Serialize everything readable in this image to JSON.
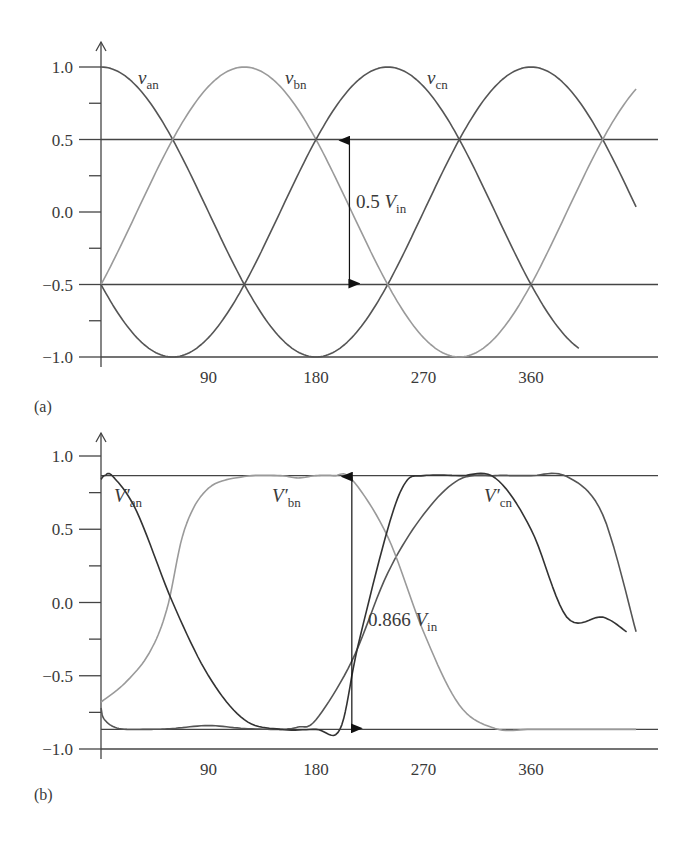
{
  "chart_data": [
    {
      "id": "a",
      "type": "line",
      "panel_label": "(a)",
      "title": "",
      "xlabel": "",
      "ylabel": "",
      "x_unit": "degrees",
      "xlim": [
        0,
        450
      ],
      "ylim": [
        -1.0,
        1.0
      ],
      "x_ticks": [
        90,
        180,
        270,
        360
      ],
      "x_tick_labels": [
        "90",
        "180",
        "270",
        "360"
      ],
      "y_ticks": [
        1.0,
        0.5,
        0.0,
        -0.5,
        -1.0
      ],
      "y_tick_labels": [
        "1.0",
        "0.5",
        "0.0",
        "−0.5",
        "−1.0"
      ],
      "y_minor_ticks": [
        0.75,
        0.25,
        -0.25,
        -0.75
      ],
      "reference_lines": [
        0.5,
        -0.5,
        -1.0
      ],
      "grid": false,
      "series": [
        {
          "name": "v_an",
          "label": "v",
          "subscript": "an",
          "formula": "cos(θ)",
          "phase_deg": 0,
          "x_range": [
            0,
            448
          ],
          "color": "#555555",
          "x": [
            0,
            60,
            120,
            180,
            240,
            300,
            360,
            420,
            448
          ],
          "values": [
            1.0,
            0.5,
            -0.5,
            -1.0,
            -0.5,
            0.5,
            1.0,
            0.5,
            0.03
          ]
        },
        {
          "name": "v_bn",
          "label": "v",
          "subscript": "bn",
          "formula": "cos(θ−120°)",
          "phase_deg": 120,
          "x_range": [
            0,
            448
          ],
          "color": "#9a9a9a",
          "x": [
            0,
            60,
            120,
            180,
            240,
            300,
            360,
            420,
            448
          ],
          "values": [
            -0.5,
            0.5,
            1.0,
            0.5,
            -0.5,
            -1.0,
            -0.5,
            0.5,
            0.8
          ]
        },
        {
          "name": "v_cn",
          "label": "v",
          "subscript": "cn",
          "formula": "cos(θ−240°)",
          "phase_deg": 240,
          "x_range": [
            0,
            400
          ],
          "color": "#555555",
          "x": [
            0,
            60,
            120,
            180,
            240,
            300,
            360,
            400
          ],
          "values": [
            -0.5,
            -1.0,
            -0.5,
            0.5,
            1.0,
            0.5,
            -0.5,
            -0.98
          ]
        }
      ],
      "annotations": [
        {
          "type": "double-arrow",
          "x": 208,
          "y_from": 0.5,
          "y_to": -0.5,
          "text": "0.5",
          "var": "V",
          "subscript": "in"
        }
      ]
    },
    {
      "id": "b",
      "type": "line",
      "panel_label": "(b)",
      "title": "",
      "xlabel": "",
      "ylabel": "",
      "x_unit": "degrees",
      "xlim": [
        0,
        450
      ],
      "ylim": [
        -1.0,
        1.0
      ],
      "x_ticks": [
        90,
        180,
        270,
        360
      ],
      "x_tick_labels": [
        "90",
        "180",
        "270",
        "360"
      ],
      "y_ticks": [
        1.0,
        0.5,
        0.0,
        -0.5,
        -1.0
      ],
      "y_tick_labels": [
        "1.0",
        "0.5",
        "0.0",
        "−0.5",
        "−1.0"
      ],
      "y_minor_ticks": [
        0.75,
        0.25,
        -0.25,
        -0.75
      ],
      "reference_lines": [
        0.866,
        -0.866,
        -1.0
      ],
      "grid": false,
      "series": [
        {
          "name": "V'_an",
          "label": "V′",
          "subscript": "an",
          "color": "#555555",
          "x": [
            0,
            3,
            15,
            40,
            60,
            90,
            120,
            150,
            165,
            180,
            210,
            240,
            270,
            300,
            330,
            345,
            360,
            390,
            420,
            448
          ],
          "values": [
            -0.72,
            -0.8,
            -0.86,
            -0.866,
            -0.86,
            -0.84,
            -0.86,
            -0.866,
            -0.85,
            -0.8,
            -0.4,
            0.2,
            0.6,
            0.84,
            0.866,
            0.866,
            0.866,
            0.86,
            0.6,
            -0.2
          ]
        },
        {
          "name": "V'_bn",
          "label": "V′",
          "subscript": "bn",
          "color": "#9a9a9a",
          "x": [
            0,
            20,
            40,
            55,
            70,
            90,
            120,
            150,
            165,
            180,
            195,
            210,
            240,
            270,
            300,
            330,
            360,
            390,
            420,
            448
          ],
          "values": [
            -0.68,
            -0.55,
            -0.35,
            -0.05,
            0.5,
            0.78,
            0.86,
            0.866,
            0.85,
            0.866,
            0.866,
            0.84,
            0.45,
            -0.2,
            -0.7,
            -0.86,
            -0.866,
            -0.866,
            -0.866,
            -0.866
          ]
        },
        {
          "name": "V'_cn",
          "label": "V′",
          "subscript": "cn",
          "color": "#333333",
          "x": [
            0,
            3,
            10,
            30,
            60,
            90,
            120,
            150,
            180,
            200,
            215,
            240,
            255,
            270,
            300,
            330,
            360,
            390,
            420,
            440
          ],
          "values": [
            0.84,
            0.866,
            0.86,
            0.62,
            0.0,
            -0.5,
            -0.8,
            -0.866,
            -0.866,
            -0.866,
            -0.3,
            0.5,
            0.82,
            0.866,
            0.866,
            0.85,
            0.5,
            -0.1,
            -0.1,
            -0.2
          ]
        }
      ],
      "annotations": [
        {
          "type": "double-arrow",
          "x": 210,
          "y_from": 0.866,
          "y_to": -0.866,
          "text": "0.866",
          "var": "V",
          "subscript": "in"
        }
      ]
    }
  ],
  "labels": {
    "a": {
      "panel": "(a)",
      "van": "an",
      "vbn": "bn",
      "vcn": "cn",
      "arrow_value": "0.5",
      "arrow_var": "V",
      "arrow_sub": "in"
    },
    "b": {
      "panel": "(b)",
      "van": "an",
      "vbn": "bn",
      "vcn": "cn",
      "arrow_value": "0.866",
      "arrow_var": "V",
      "arrow_sub": "in"
    }
  }
}
